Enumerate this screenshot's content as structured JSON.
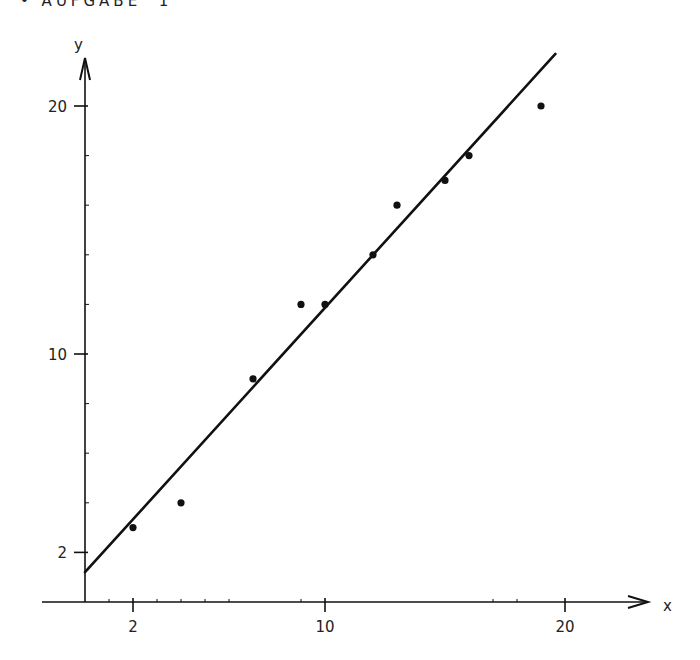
{
  "title": "• AUFGABE  1",
  "chart_data": {
    "type": "scatter",
    "title": "AUFGABE 1",
    "xlabel": "x",
    "ylabel": "y",
    "xlim": [
      0,
      23
    ],
    "ylim": [
      0,
      22
    ],
    "grid": false,
    "legend": null,
    "x_tick_labels": [
      {
        "value": 2,
        "label": "2"
      },
      {
        "value": 10,
        "label": "10"
      },
      {
        "value": 20,
        "label": "20"
      }
    ],
    "y_tick_labels": [
      {
        "value": 2,
        "label": "2"
      },
      {
        "value": 10,
        "label": "10"
      },
      {
        "value": 20,
        "label": "20"
      }
    ],
    "x_minor_ticks": [
      1,
      3,
      4,
      5,
      6,
      9,
      17,
      18
    ],
    "y_minor_ticks": [
      4,
      6,
      8,
      12,
      14,
      16,
      18
    ],
    "series": [
      {
        "name": "data points",
        "type": "scatter",
        "points": [
          {
            "x": 2,
            "y": 3
          },
          {
            "x": 4,
            "y": 4
          },
          {
            "x": 7,
            "y": 9
          },
          {
            "x": 9,
            "y": 12
          },
          {
            "x": 10,
            "y": 12
          },
          {
            "x": 12,
            "y": 14
          },
          {
            "x": 13,
            "y": 16
          },
          {
            "x": 15,
            "y": 17
          },
          {
            "x": 16,
            "y": 18
          },
          {
            "x": 19,
            "y": 20
          }
        ]
      },
      {
        "name": "regression line",
        "type": "line",
        "points": [
          {
            "x": 0,
            "y": 1.2
          },
          {
            "x": 19.6,
            "y": 22.1
          }
        ]
      }
    ]
  },
  "colors": {
    "ink": "#111111",
    "background": "#ffffff"
  }
}
